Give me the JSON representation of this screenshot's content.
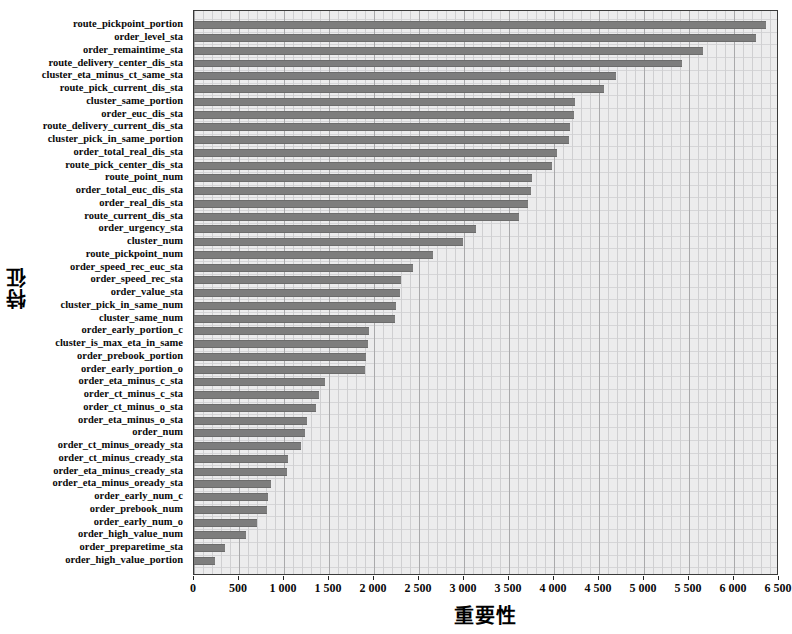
{
  "chart_data": {
    "type": "bar",
    "orientation": "horizontal",
    "title": "",
    "xlabel": "重要性",
    "ylabel": "特征",
    "xlim": [
      0,
      6500
    ],
    "xticks": [
      0,
      500,
      1000,
      1500,
      2000,
      2500,
      3000,
      3500,
      4000,
      4500,
      5000,
      5500,
      6000,
      6500
    ],
    "xtick_labels": [
      "0",
      "500",
      "1 000",
      "1 500",
      "2 000",
      "2 500",
      "3 000",
      "3 500",
      "4 000",
      "4 500",
      "5 000",
      "5 500",
      "6 000",
      "6 500"
    ],
    "grid": true,
    "legend": null,
    "bar_color": "#7d7d7d",
    "plot_background": "#ececed",
    "categories": [
      "route_pickpoint_portion",
      "order_level_sta",
      "order_remaintime_sta",
      "route_delivery_center_dis_sta",
      "cluster_eta_minus_ct_same_sta",
      "route_pick_current_dis_sta",
      "cluster_same_portion",
      "order_euc_dis_sta",
      "route_delivery_current_dis_sta",
      "cluster_pick_in_same_portion",
      "order_total_real_dis_sta",
      "route_pick_center_dis_sta",
      "route_point_num",
      "order_total_euc_dis_sta",
      "order_real_dis_sta",
      "route_current_dis_sta",
      "order_urgency_sta",
      "cluster_num",
      "route_pickpoint_num",
      "order_speed_rec_euc_sta",
      "order_speed_rec_sta",
      "order_value_sta",
      "cluster_pick_in_same_num",
      "cluster_same_num",
      "order_early_portion_c",
      "cluster_is_max_eta_in_same",
      "order_prebook_portion",
      "order_early_portion_o",
      "order_eta_minus_c_sta",
      "order_ct_minus_c_sta",
      "order_ct_minus_o_sta",
      "order_eta_minus_o_sta",
      "order_num",
      "order_ct_minus_oready_sta",
      "order_ct_minus_cready_sta",
      "order_eta_minus_cready_sta",
      "order_eta_minus_oready_sta",
      "order_early_num_c",
      "order_prebook_num",
      "order_early_num_o",
      "order_high_value_num",
      "order_preparetime_sta",
      "order_high_value_portion"
    ],
    "values": [
      6360,
      6240,
      5650,
      5420,
      4690,
      4550,
      4230,
      4220,
      4180,
      4170,
      4030,
      3980,
      3760,
      3740,
      3710,
      3610,
      3130,
      2990,
      2660,
      2430,
      2300,
      2290,
      2240,
      2230,
      1940,
      1930,
      1910,
      1900,
      1450,
      1390,
      1350,
      1250,
      1230,
      1190,
      1040,
      1030,
      860,
      820,
      810,
      700,
      580,
      340,
      230
    ]
  }
}
